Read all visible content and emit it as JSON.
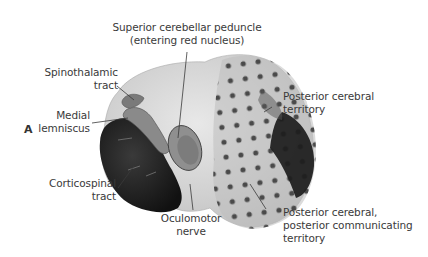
{
  "figure": {
    "panel_letter": "A",
    "colors": {
      "background": "#ffffff",
      "brainstem_light": "#d9d9d9",
      "brainstem_mid": "#b5b5b5",
      "peduncle_dark": "#1e1e1e",
      "dot_pattern": "#4a4a4a",
      "label_text": "#3a3a3a",
      "leader_line": "#3a3a3a"
    },
    "labels": {
      "superior_cerebellar_peduncle": [
        "Superior cerebellar peduncle",
        "(entering red nucleus)"
      ],
      "spinothalamic_tract": [
        "Spinothalamic",
        "tract"
      ],
      "medial_lemniscus": [
        "Medial",
        "lemniscus"
      ],
      "corticospinal_tract": [
        "Corticospinal",
        "tract"
      ],
      "oculomotor_nerve": [
        "Oculomotor",
        "nerve"
      ],
      "posterior_cerebral_territory": [
        "Posterior cerebral",
        "territory"
      ],
      "posterior_cerebral_communicating_territory": [
        "Posterior cerebral,",
        "posterior communicating",
        "territory"
      ]
    }
  }
}
